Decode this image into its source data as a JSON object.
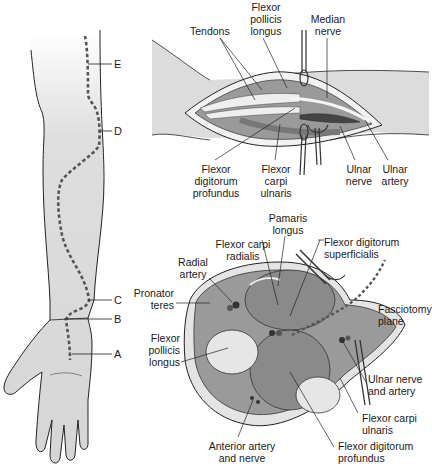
{
  "colors": {
    "skin": "#dcdcdc",
    "muscle": "#8f8f8f",
    "muscle_light": "#b5b5b5",
    "tendon": "#ececec",
    "outline": "#222222",
    "incision_dash": "#555555",
    "bone": "#e2e2e2"
  },
  "arm_view": {
    "incision_markers": [
      {
        "id": "E",
        "label": "E"
      },
      {
        "id": "D",
        "label": "D"
      },
      {
        "id": "C",
        "label": "C"
      },
      {
        "id": "B",
        "label": "B"
      },
      {
        "id": "A",
        "label": "A"
      }
    ]
  },
  "exposure_view": {
    "labels": {
      "tendons": "Tendons",
      "fpl": [
        "Flexor",
        "pollicis",
        "longus"
      ],
      "median_nerve": [
        "Median",
        "nerve"
      ],
      "fdp": [
        "Flexor",
        "digitorum",
        "profundus"
      ],
      "fcu": [
        "Flexor",
        "carpi",
        "ulnaris"
      ],
      "ulnar_nerve": [
        "Ulnar",
        "nerve"
      ],
      "ulnar_artery": [
        "Ulnar",
        "artery"
      ]
    }
  },
  "cross_section": {
    "labels": {
      "palmaris": [
        "Pamaris",
        "longus"
      ],
      "fcr": [
        "Flexor carpi",
        "radialis"
      ],
      "fds": [
        "Flexor digitorum",
        "superficialis"
      ],
      "radial_artery": [
        "Radial",
        "artery"
      ],
      "pronator": [
        "Pronator",
        "teres"
      ],
      "fasciotomy": [
        "Fasciotomy",
        "plane"
      ],
      "fpl": [
        "Flexor",
        "pollicis",
        "longus"
      ],
      "ulnar_na": [
        "Ulnar nerve",
        "and artery"
      ],
      "fcu": [
        "Flexor carpi",
        "ulnaris"
      ],
      "anterior": [
        "Anterior artery",
        "and nerve"
      ],
      "fdp": [
        "Flexor digitorum",
        "profundus"
      ]
    }
  }
}
